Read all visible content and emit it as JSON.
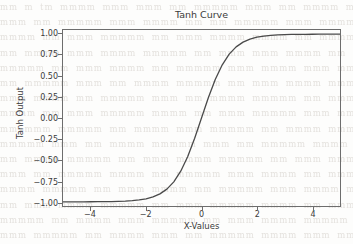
{
  "figure": {
    "background_color": "#fdfdfc",
    "axes_color": "#6d6d6d",
    "text_color": "#3a3a3a"
  },
  "background_text": {
    "note": "faint illegible scanned-page bleed-through",
    "color": "#cfcac4",
    "lines": [
      "mm m tm  mmmm mmm mmm mm  mmmmm mmm  mm mmmm mmmmm",
      "mmm mm mmmmm  mmm mmmm mm  mm  mmmmm mmm mmmmm mm",
      "mmmm mm mmm mmmmm mm mmm mmmm  mmmm mm mmmmm mmm m",
      "mm mmmm mmm  mmmm mmmmm mm mmm  mmm mmmm mm mmmmm",
      "mmmmm mm mmm mmmm  mm mmmmm mmm mmmm mmm mm mmmm m",
      "mm mmmmm mmm mm mmmm mmmmm mm  mmm mmmm mmmmm mmm",
      "mmm mmmm mm mmmmm mmm mm mmmm  mmmmm mm mmm mmmm m",
      "mmmm mm mmm mmmmm mmmm mm mmm mmmmm mmm mm mmmmm",
      "mm mmm mmmmm mm mmmm mmm mmmmm  mm mmmm mmm mmmmm",
      "mmmmm mmm mm mmmm mmmmm mmm mm  mmmmm mmmm mm mmm",
      "mm mmmm mmmmm mm mmm mmmm mmmmm mm mmm mmmmm mmmm",
      "mmm mm mmmmm mmmm mm mmmmm mmm  mmmm mm mmm mmmmm",
      "mmmm mmmmm mm mmm mmmm mm mmmmm mmm mmmm mmmmm mm",
      "mm mmm mmmm mmmmm mm mmm mmmmm mmmm mm mmmmm mmm",
      "mmmmm mm mmmm mmm mmmmm mm mmm mmmm mmmmm mmm mm",
      "mmm mmmmm mm mmmm mmm mm mmmmm mmmm mmm mm mmmmm"
    ]
  },
  "chart_data": {
    "type": "line",
    "title": "Tanh Curve",
    "xlabel": "X-Values",
    "ylabel": "Tanh Output",
    "xlim": [
      -5,
      5
    ],
    "ylim": [
      -1.05,
      1.05
    ],
    "grid": false,
    "legend": false,
    "line_color": "#4a4a4a",
    "line_width": 1.3,
    "xticks": [
      -4,
      -2,
      0,
      2,
      4
    ],
    "xtick_labels": [
      "−4",
      "−2",
      "0",
      "2",
      "4"
    ],
    "yticks": [
      1.0,
      0.75,
      0.5,
      0.25,
      0.0,
      -0.25,
      -0.5,
      -0.75,
      -1.0
    ],
    "ytick_labels": [
      "1.00",
      "0.75",
      "0.50",
      "0.25",
      "0.00",
      "−0.25",
      "−0.50",
      "−0.75",
      "−1.00"
    ],
    "series": [
      {
        "name": "tanh(x)",
        "x": [
          -5.0,
          -4.75,
          -4.5,
          -4.25,
          -4.0,
          -3.75,
          -3.5,
          -3.25,
          -3.0,
          -2.75,
          -2.5,
          -2.25,
          -2.0,
          -1.75,
          -1.5,
          -1.25,
          -1.0,
          -0.75,
          -0.5,
          -0.25,
          0.0,
          0.25,
          0.5,
          0.75,
          1.0,
          1.25,
          1.5,
          1.75,
          2.0,
          2.25,
          2.5,
          2.75,
          3.0,
          3.25,
          3.5,
          3.75,
          4.0,
          4.25,
          4.5,
          4.75,
          5.0
        ],
        "y": [
          -0.9999,
          -0.9998,
          -0.9998,
          -0.9996,
          -0.9993,
          -0.9989,
          -0.9982,
          -0.997,
          -0.9951,
          -0.9919,
          -0.9866,
          -0.978,
          -0.964,
          -0.9414,
          -0.9051,
          -0.8483,
          -0.7616,
          -0.6351,
          -0.4621,
          -0.2449,
          0.0,
          0.2449,
          0.4621,
          0.6351,
          0.7616,
          0.8483,
          0.9051,
          0.9414,
          0.964,
          0.978,
          0.9866,
          0.9919,
          0.9951,
          0.997,
          0.9982,
          0.9989,
          0.9993,
          0.9996,
          0.9998,
          0.9998,
          0.9999
        ]
      }
    ]
  }
}
